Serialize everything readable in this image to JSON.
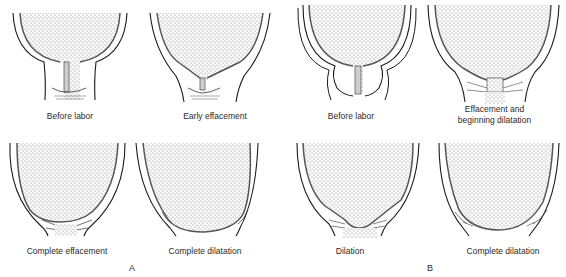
{
  "figure": {
    "type": "medical-diagram",
    "colors": {
      "outline": "#1a1a1a",
      "fill_stipple": "#8a8a8a",
      "background": "#ffffff"
    }
  },
  "groups": [
    {
      "label": "A",
      "panels": [
        {
          "caption": "Before labor"
        },
        {
          "caption": "Early effacement"
        },
        {
          "caption": "Complete effacement"
        },
        {
          "caption": "Complete dilatation"
        }
      ]
    },
    {
      "label": "B",
      "panels": [
        {
          "caption": "Before labor"
        },
        {
          "caption": "Effacement and\nbeginning dilatation"
        },
        {
          "caption": "Dilation"
        },
        {
          "caption": "Complete dilatation"
        }
      ]
    }
  ]
}
